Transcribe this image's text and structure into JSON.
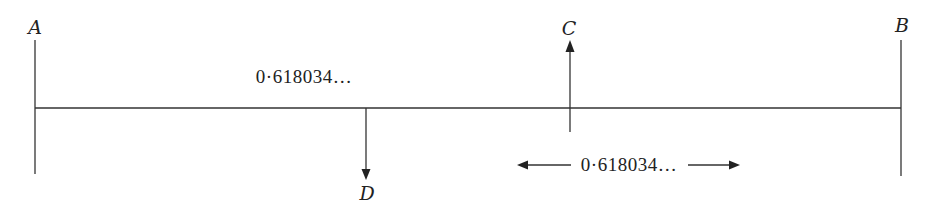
{
  "diagram": {
    "type": "golden-section-line",
    "points": {
      "A": {
        "label": "A"
      },
      "B": {
        "label": "B"
      },
      "C": {
        "label": "C"
      },
      "D": {
        "label": "D"
      }
    },
    "top_measure": {
      "label": "0·618034…"
    },
    "bottom_measure": {
      "label": "0·618034…"
    },
    "colors": {
      "stroke": "#333333",
      "text": "#222222",
      "background": "#ffffff"
    }
  }
}
